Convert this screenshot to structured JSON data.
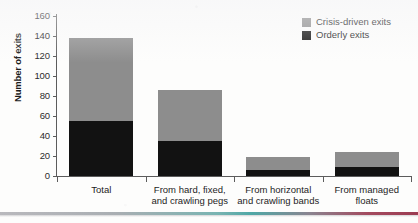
{
  "chart_data": {
    "type": "bar",
    "subtype": "stacked-bar",
    "title": "",
    "xlabel": "",
    "ylabel": "Number of exits",
    "ylim": [
      0,
      160
    ],
    "yticks": [
      0,
      20,
      40,
      60,
      80,
      100,
      120,
      140,
      160
    ],
    "grid": false,
    "legend_position": "top-right",
    "categories": [
      "Total",
      "From hard, fixed,\nand crawling pegs",
      "From horizontal\nand crawling bands",
      "From managed\nfloats"
    ],
    "category_lines": [
      [
        "Total"
      ],
      [
        "From hard, fixed,",
        "and crawling pegs"
      ],
      [
        "From horizontal",
        "and crawling bands"
      ],
      [
        "From managed",
        "floats"
      ]
    ],
    "series": [
      {
        "name": "Orderly exits",
        "color": "#121212",
        "values": [
          55,
          35,
          6,
          9
        ]
      },
      {
        "name": "Crisis-driven exits",
        "color": "#8d8d8d",
        "values": [
          83,
          51,
          13,
          15
        ]
      }
    ],
    "totals": [
      138,
      86,
      19,
      24
    ],
    "stack_order_bottom_to_top": [
      "Orderly exits",
      "Crisis-driven exits"
    ]
  },
  "legend": {
    "items": [
      {
        "label": "Crisis-driven exits",
        "color": "#8d8d8d"
      },
      {
        "label": "Orderly exits",
        "color": "#121212"
      }
    ]
  },
  "axis": {
    "y_title": "Number of exits",
    "y_tick_labels": [
      "160",
      "140",
      "120",
      "100",
      "80",
      "60",
      "40",
      "20",
      "0"
    ]
  }
}
